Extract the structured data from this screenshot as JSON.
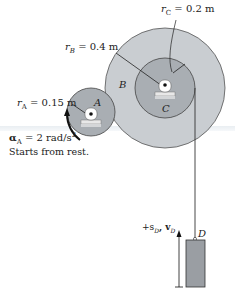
{
  "figure": {
    "gears": {
      "A": {
        "label": "A",
        "radius_label": "r",
        "radius_sub": "A",
        "radius_value": "= 0.15 m"
      },
      "B": {
        "label": "B",
        "radius_label": "r",
        "radius_sub": "B",
        "radius_value": "= 0.4 m"
      },
      "C": {
        "label": "C",
        "radius_label": "r",
        "radius_sub": "C",
        "radius_value": "= 0.2 m"
      }
    },
    "alpha": {
      "symbol": "α",
      "sub": "A",
      "value": "= 2 rad/s",
      "exp": "2"
    },
    "note": "Starts from rest.",
    "block": {
      "label": "D",
      "direction_label": "+s",
      "direction_sub1": "D",
      "direction_sep": ", v",
      "direction_sub2": "D"
    },
    "colors": {
      "gear_outer": "#c9cdd1",
      "gear_inner": "#a9aeb3",
      "block": "#9a9ea3",
      "line": "#222222"
    }
  }
}
